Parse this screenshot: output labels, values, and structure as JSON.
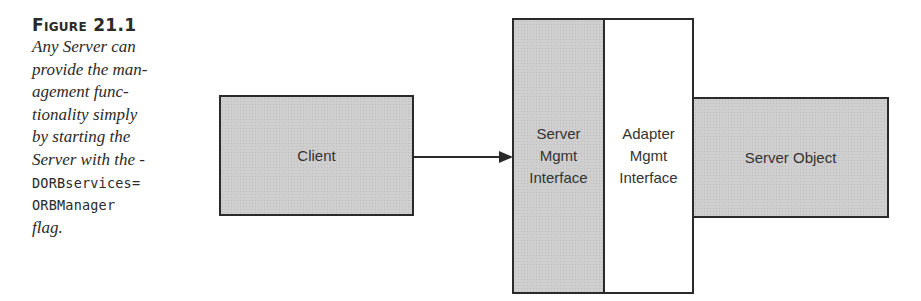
{
  "caption": {
    "title": "Figure 21.1",
    "lines": [
      {
        "text": "Any Server can",
        "style": "italic"
      },
      {
        "text": "provide the man-",
        "style": "italic"
      },
      {
        "text": "agement func-",
        "style": "italic"
      },
      {
        "text": "tionality simply",
        "style": "italic"
      },
      {
        "text": "by starting the",
        "style": "italic"
      },
      {
        "text": "Server with the  -",
        "style": "italic"
      },
      {
        "text": "DORBservices=",
        "style": "mono"
      },
      {
        "text": "ORBManager",
        "style": "mono"
      },
      {
        "text": "flag.",
        "style": "italic"
      }
    ]
  },
  "diagram": {
    "client": {
      "label": "Client",
      "fill": "#cfcfcf"
    },
    "server_mgmt_interface": {
      "lines": [
        "Server",
        "Mgmt",
        "Interface"
      ],
      "fill": "#cfcfcf"
    },
    "adapter_mgmt_interface": {
      "lines": [
        "Adapter",
        "Mgmt",
        "Interface"
      ],
      "fill": "#ffffff"
    },
    "server_object": {
      "label": "Server Object",
      "fill": "#cfcfcf"
    },
    "arrow": {
      "from": "Client",
      "to": "Server Mgmt Interface"
    },
    "stroke_color": "#2a2a2a"
  }
}
